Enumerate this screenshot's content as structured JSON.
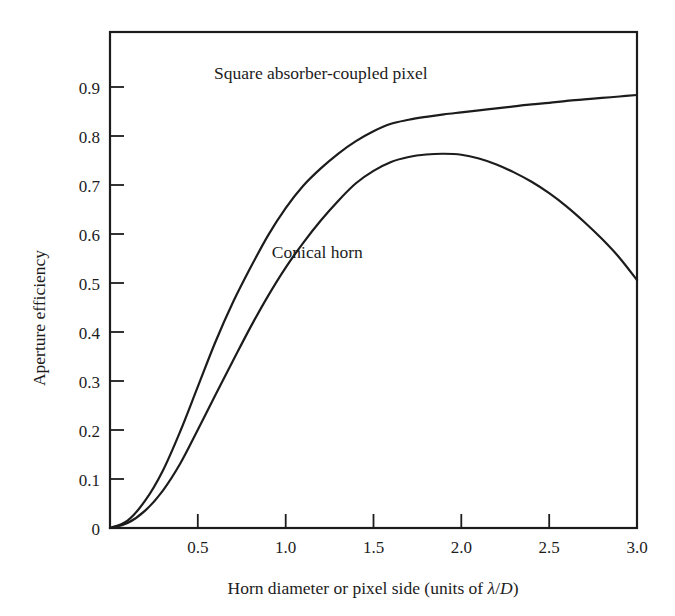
{
  "chart_data": {
    "type": "line",
    "title": "",
    "xlabel": "Horn diameter or pixel side (units of λ/D)",
    "ylabel": "Aperture efficiency",
    "xlim": [
      0,
      3.0
    ],
    "ylim": [
      0,
      1.0
    ],
    "grid": false,
    "legend_position": "inline-annotations",
    "xticks": [
      0,
      0.5,
      1.0,
      1.5,
      2.0,
      2.5,
      3.0
    ],
    "xticklabels": [
      "",
      "0.5",
      "1.0",
      "1.5",
      "2.0",
      "2.5",
      "3.0"
    ],
    "yticks": [
      0,
      0.1,
      0.2,
      0.3,
      0.4,
      0.5,
      0.6,
      0.7,
      0.8,
      0.9
    ],
    "yticklabels": [
      "0",
      "0.1",
      "0.2",
      "0.3",
      "0.4",
      "0.5",
      "0.6",
      "0.7",
      "0.8",
      "0.9"
    ],
    "x": [
      0.0,
      0.1,
      0.2,
      0.3,
      0.4,
      0.5,
      0.6,
      0.7,
      0.8,
      0.9,
      1.0,
      1.1,
      1.2,
      1.3,
      1.4,
      1.5,
      1.6,
      1.7,
      1.8,
      1.9,
      2.0,
      2.1,
      2.2,
      2.3,
      2.4,
      2.5,
      2.6,
      2.7,
      2.8,
      2.9,
      3.0
    ],
    "series": [
      {
        "name": "Square absorber-coupled pixel",
        "color": "#1c1c1c",
        "values": [
          0.0,
          0.015,
          0.055,
          0.115,
          0.195,
          0.285,
          0.375,
          0.455,
          0.525,
          0.59,
          0.645,
          0.69,
          0.725,
          0.755,
          0.78,
          0.8,
          0.815,
          0.823,
          0.829,
          0.834,
          0.838,
          0.842,
          0.846,
          0.85,
          0.854,
          0.857,
          0.861,
          0.864,
          0.867,
          0.87,
          0.873
        ],
        "label_text": "Square absorber-coupled pixel",
        "label_x": 1.2,
        "label_y": 0.905
      },
      {
        "name": "Conical horn",
        "color": "#1c1c1c",
        "values": [
          0.0,
          0.01,
          0.035,
          0.075,
          0.13,
          0.198,
          0.268,
          0.337,
          0.405,
          0.468,
          0.525,
          0.575,
          0.62,
          0.66,
          0.695,
          0.72,
          0.738,
          0.748,
          0.753,
          0.7545,
          0.7525,
          0.745,
          0.733,
          0.717,
          0.698,
          0.675,
          0.648,
          0.617,
          0.583,
          0.545,
          0.5
        ],
        "label_text": "Conical horn",
        "label_x": 1.18,
        "label_y": 0.545
      }
    ]
  },
  "axes": {
    "x_axis_title": "Horn diameter or pixel side (units of λ/D)",
    "x_axis_title_parts": {
      "prefix": "Horn diameter or pixel side (units of ",
      "lambda": "λ",
      "slash": "/",
      "d": "D",
      "suffix": ")"
    },
    "y_axis_title": "Aperture efficiency"
  },
  "colors": {
    "line": "#1c1c1c",
    "frame": "#1c1c1c",
    "background": "#ffffff",
    "text": "#1c1c1c"
  }
}
